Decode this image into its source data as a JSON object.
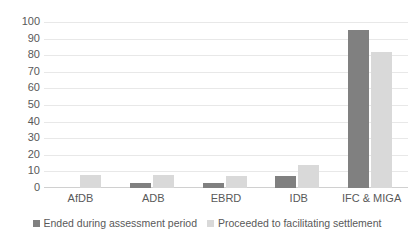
{
  "chart_data": {
    "type": "bar",
    "title": "",
    "subtitle": "",
    "xlabel": "",
    "ylabel": "",
    "ylim": [
      0,
      100
    ],
    "ytick_step": 10,
    "yticks": [
      100,
      90,
      80,
      70,
      60,
      50,
      40,
      30,
      20,
      10,
      0
    ],
    "ytick_labels": [
      "100",
      "90",
      "80",
      "70",
      "60",
      "50",
      "40",
      "30",
      "20",
      "10",
      "0"
    ],
    "grid": true,
    "grid_axis": "y",
    "legend_position": "bottom",
    "categories": [
      "AfDB",
      "ADB",
      "EBRD",
      "IDB",
      "IFC & MIGA"
    ],
    "series": [
      {
        "name": "Ended during assessment period",
        "color": "#808080",
        "values": [
          0,
          3,
          3,
          7,
          95
        ]
      },
      {
        "name": "Proceeded to facilitating settlement",
        "color": "#d9d9d9",
        "values": [
          8,
          8,
          7,
          14,
          82
        ]
      }
    ]
  },
  "colors": {
    "series_dark": "#808080",
    "series_light": "#d9d9d9",
    "gridline": "#e8e8e8",
    "text": "#595959",
    "background": "#ffffff"
  }
}
